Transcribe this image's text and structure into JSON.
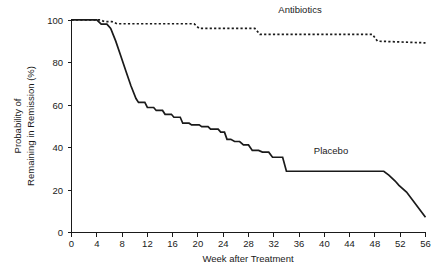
{
  "figure": {
    "background_color": "#ffffff",
    "ink_color": "#1a1a1a"
  },
  "chart_data": {
    "type": "line",
    "title": "",
    "subtitle": "",
    "xlabel": "Week after Treatment",
    "ylabel": "Probability of Remaining in Remission (%)",
    "ylabel_line1": "Probability of",
    "ylabel_line2": "Remaining in Remission (%)",
    "xlim": [
      0,
      56
    ],
    "ylim": [
      0,
      100
    ],
    "grid": false,
    "legend_position": "inline-annotations",
    "xticks": [
      0,
      4,
      8,
      12,
      16,
      20,
      24,
      28,
      32,
      36,
      40,
      44,
      48,
      52,
      56
    ],
    "xtick_labels": [
      "0",
      "4",
      "8",
      "12",
      "16",
      "20",
      "24",
      "28",
      "32",
      "36",
      "40",
      "44",
      "48",
      "52",
      "56"
    ],
    "yticks": [
      0,
      20,
      40,
      60,
      80,
      100
    ],
    "ytick_labels": [
      "0",
      "20",
      "40",
      "60",
      "80",
      "100"
    ],
    "series": [
      {
        "name": "Antibiotics",
        "style": "dashed",
        "label_x": 56,
        "label_y": 100,
        "annotation": "Antibiotics",
        "step": "post",
        "x": [
          0,
          4.6,
          5.2,
          6.4,
          7.2,
          19.4,
          20.2,
          29.0,
          29.8,
          47.6,
          48.4,
          56
        ],
        "y": [
          100,
          100,
          99.2,
          99.2,
          98.2,
          98.2,
          96.0,
          96.0,
          93.2,
          93.2,
          90.0,
          89.2
        ],
        "points": [
          {
            "week": 0,
            "value": 100
          },
          {
            "week": 4.6,
            "value": 100
          },
          {
            "week": 5.2,
            "value": 99.2
          },
          {
            "week": 6.4,
            "value": 99.2
          },
          {
            "week": 7.2,
            "value": 98.2
          },
          {
            "week": 19.4,
            "value": 98.2
          },
          {
            "week": 20.2,
            "value": 96.0
          },
          {
            "week": 29.0,
            "value": 96.0
          },
          {
            "week": 29.8,
            "value": 93.2
          },
          {
            "week": 47.6,
            "value": 93.2
          },
          {
            "week": 48.4,
            "value": 90.0
          },
          {
            "week": 56,
            "value": 89.2
          }
        ]
      },
      {
        "name": "Placebo",
        "style": "solid",
        "annotation": "Placebo",
        "step": "post",
        "x": [
          0,
          4.0,
          4.7,
          5.6,
          6.2,
          7.0,
          7.8,
          8.6,
          9.4,
          10.2,
          10.6,
          11.6,
          12.0,
          13.0,
          13.4,
          14.4,
          14.8,
          15.8,
          16.2,
          17.2,
          17.6,
          18.6,
          19.0,
          20.2,
          20.6,
          21.6,
          22.0,
          23.2,
          23.6,
          24.2,
          24.6,
          25.2,
          25.8,
          26.6,
          27.2,
          28.0,
          28.6,
          29.6,
          30.2,
          31.2,
          31.8,
          33.4,
          34.0,
          49.4,
          50.2,
          51.2,
          51.8,
          53.0,
          56
        ],
        "y": [
          100,
          100,
          98.0,
          98.0,
          96.0,
          90.0,
          83.0,
          76.0,
          69.0,
          63.0,
          61.2,
          61.2,
          58.8,
          58.8,
          57.4,
          57.4,
          55.6,
          55.6,
          54.2,
          54.2,
          51.4,
          51.4,
          50.6,
          50.6,
          49.8,
          49.8,
          48.6,
          48.6,
          47.2,
          47.2,
          43.8,
          43.8,
          42.8,
          42.8,
          41.2,
          41.2,
          38.6,
          38.6,
          37.8,
          37.8,
          35.4,
          35.4,
          28.8,
          28.8,
          27.0,
          24.2,
          22.2,
          19.0,
          7.2
        ],
        "key_points": [
          {
            "week": 0,
            "value": 100
          },
          {
            "week": 4,
            "value": 100
          },
          {
            "week": 5,
            "value": 98
          },
          {
            "week": 10,
            "value": 63
          },
          {
            "week": 12,
            "value": 59
          },
          {
            "week": 16,
            "value": 55
          },
          {
            "week": 20,
            "value": 51
          },
          {
            "week": 24,
            "value": 47
          },
          {
            "week": 26,
            "value": 43
          },
          {
            "week": 30,
            "value": 38
          },
          {
            "week": 34,
            "value": 35
          },
          {
            "week": 36,
            "value": 29
          },
          {
            "week": 50,
            "value": 29
          },
          {
            "week": 52,
            "value": 22
          },
          {
            "week": 56,
            "value": 7
          }
        ]
      }
    ]
  }
}
